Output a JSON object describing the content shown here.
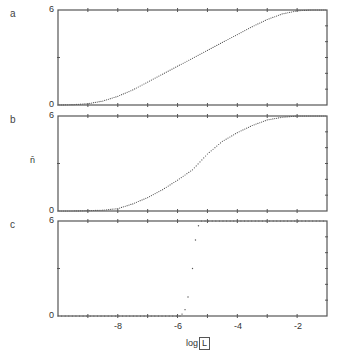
{
  "chart_data": [
    {
      "panel": "a",
      "type": "scatter",
      "xlabel": "log[L]",
      "ylabel": "n̄",
      "xlim": [
        -10,
        -1
      ],
      "ylim": [
        0,
        6
      ],
      "yticks_labeled": [
        "0",
        "6"
      ],
      "x": [
        -10.0,
        -9.5,
        -9.0,
        -8.5,
        -8.0,
        -7.5,
        -7.0,
        -6.5,
        -6.0,
        -5.5,
        -5.0,
        -4.5,
        -4.0,
        -3.5,
        -3.0,
        -2.5,
        -2.0,
        -1.5,
        -1.0
      ],
      "y": [
        0.0,
        0.02,
        0.08,
        0.25,
        0.55,
        0.95,
        1.45,
        1.95,
        2.45,
        2.95,
        3.45,
        3.95,
        4.45,
        4.95,
        5.4,
        5.75,
        5.95,
        6.0,
        6.0
      ]
    },
    {
      "panel": "b",
      "type": "scatter",
      "xlabel": "log[L]",
      "ylabel": "n̄",
      "xlim": [
        -10,
        -1
      ],
      "ylim": [
        0,
        6
      ],
      "yticks_labeled": [
        "0",
        "6"
      ],
      "x": [
        -10.0,
        -9.5,
        -9.0,
        -8.5,
        -8.0,
        -7.5,
        -7.0,
        -6.5,
        -6.0,
        -5.5,
        -5.0,
        -4.5,
        -4.0,
        -3.5,
        -3.0,
        -2.5,
        -2.0,
        -1.5,
        -1.0
      ],
      "y": [
        0.0,
        0.0,
        0.02,
        0.05,
        0.15,
        0.45,
        0.85,
        1.35,
        1.95,
        2.6,
        3.6,
        4.4,
        4.95,
        5.4,
        5.75,
        5.92,
        6.0,
        6.0,
        6.0
      ]
    },
    {
      "panel": "c",
      "type": "scatter",
      "xlabel": "log[L]",
      "ylabel": "n̄",
      "xlim": [
        -10,
        -1
      ],
      "ylim": [
        0,
        6
      ],
      "yticks_labeled": [
        "0",
        "6"
      ],
      "x": [
        -10.0,
        -9.0,
        -8.0,
        -7.0,
        -6.0,
        -5.85,
        -5.75,
        -5.65,
        -5.5,
        -5.4,
        -5.3,
        -5.2,
        -5.0,
        -4.0,
        -3.0,
        -2.0,
        -1.0
      ],
      "y": [
        0.0,
        0.0,
        0.0,
        0.0,
        0.02,
        0.12,
        0.4,
        1.2,
        3.0,
        4.8,
        5.7,
        6.0,
        6.0,
        6.0,
        6.0,
        6.0,
        6.0
      ]
    }
  ],
  "figure": {
    "panel_letters": [
      "a",
      "b",
      "c"
    ],
    "y_axis_symbol": "n̄",
    "y_tick_top": "6",
    "y_tick_bottom": "0",
    "x_tick_labels": [
      "-8",
      "-6",
      "-4",
      "-2"
    ],
    "x_axis_title_prefix": "log",
    "x_axis_title_inner": "L",
    "colors": {
      "axis": "#555555",
      "points": "#555555",
      "background": "#ffffff"
    }
  }
}
